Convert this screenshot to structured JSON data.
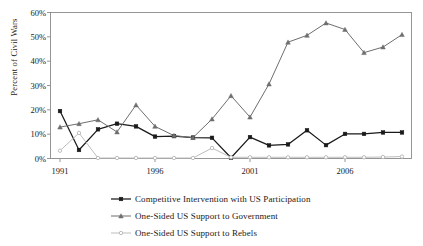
{
  "chart_data": {
    "type": "line",
    "title": "",
    "xlabel": "",
    "ylabel": "Percent of Civil Wars",
    "x": [
      1991,
      1992,
      1993,
      1994,
      1995,
      1996,
      1997,
      1998,
      1999,
      2000,
      2001,
      2002,
      2003,
      2004,
      2005,
      2006,
      2007,
      2008,
      2009
    ],
    "xlim": [
      1990.5,
      2009.5
    ],
    "ylim": [
      0,
      60
    ],
    "xticks": [
      1991,
      1996,
      2001,
      2006
    ],
    "xtick_labels": [
      "1991",
      "1996",
      "2001",
      "2006"
    ],
    "yticks": [
      0,
      10,
      20,
      30,
      40,
      50,
      60
    ],
    "ytick_labels": [
      "0%",
      "10%",
      "20%",
      "30%",
      "40%",
      "50%",
      "60%"
    ],
    "grid": false,
    "legend_position": "below",
    "series": [
      {
        "name": "Competitive Intervention with US Participation",
        "color": "#1a1a1a",
        "marker": "square",
        "values": [
          19.5,
          3.5,
          12.0,
          14.3,
          13.2,
          9.0,
          9.2,
          8.6,
          8.5,
          0.3,
          8.8,
          5.4,
          5.8,
          11.6,
          5.5,
          10.1,
          10.1,
          10.7,
          10.7
        ]
      },
      {
        "name": "One-Sided US Support to Government",
        "color": "#6e6e6e",
        "marker": "triangle",
        "values": [
          12.9,
          14.3,
          15.9,
          10.9,
          22.0,
          13.2,
          9.4,
          8.6,
          16.2,
          25.8,
          17.0,
          30.6,
          47.8,
          50.6,
          55.7,
          53.0,
          43.5,
          45.8,
          50.9
        ]
      },
      {
        "name": "One-Sided US Support to Rebels",
        "color": "#bdbdbd",
        "marker": "circle",
        "values": [
          3.2,
          10.5,
          0.2,
          0.2,
          0.2,
          0.2,
          0.2,
          0.2,
          4.3,
          0.5,
          0.5,
          0.5,
          0.5,
          0.5,
          0.5,
          0.5,
          0.5,
          0.6,
          0.8
        ]
      }
    ]
  },
  "axes": {
    "y_axis_label": "Percent of Civil Wars"
  },
  "legend": {
    "items": [
      {
        "label": "Competitive Intervention with US Participation",
        "color": "#1a1a1a"
      },
      {
        "label": "One-Sided US Support to Government",
        "color": "#6e6e6e"
      },
      {
        "label": "One-Sided US Support to Rebels",
        "color": "#bdbdbd"
      }
    ]
  }
}
